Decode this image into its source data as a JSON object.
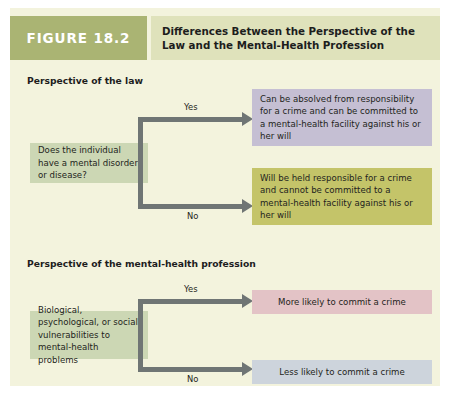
{
  "figure": {
    "number_label": "FIGURE 18.2",
    "title": "Differences Between the Perspective of the Law and the Mental-Health Profession",
    "colors": {
      "panel_background": "#f3f3dd",
      "number_block": "#aab473",
      "title_block": "#dfe2bb",
      "source_box": "#ccd7b4",
      "law_yes_outcome": "#c5bfd3",
      "law_no_outcome": "#c4c469",
      "mh_yes_outcome": "#e3c3c6",
      "mh_no_outcome": "#cdd4dc",
      "connector": "#6f7574"
    }
  },
  "law_section": {
    "heading": "Perspective of the law",
    "source": "Does the individual have a mental disorder or disease?",
    "yes_label": "Yes",
    "no_label": "No",
    "yes_outcome": "Can be absolved from responsibility for a crime and can be committed to a mental-health facility against his or her will",
    "no_outcome": "Will be held responsible for a crime and cannot be committed to a mental-health facility against his or her will"
  },
  "mental_health_section": {
    "heading": "Perspective of the mental-health profession",
    "source": "Biological, psychological, or social vulnerabilities to mental-health problems",
    "yes_label": "Yes",
    "no_label": "No",
    "yes_outcome": "More likely to commit a crime",
    "no_outcome": "Less likely to commit a crime"
  }
}
